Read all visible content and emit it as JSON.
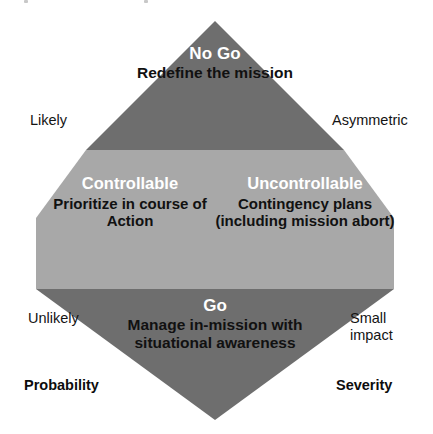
{
  "diagram": {
    "shape": "diamond",
    "colors": {
      "band_dark": "#6e6e6e",
      "band_light": "#a8a8a8",
      "background": "#ffffff",
      "heading_text": "#ffffff",
      "body_text": "#111111",
      "label_text": "#141414"
    },
    "segments": [
      {
        "id": "no-go",
        "position": "top",
        "heading": "No Go",
        "body": "Redefine\nthe mission",
        "fill": "#6e6e6e"
      },
      {
        "id": "controllable",
        "position": "middle-left",
        "heading": "Controllable",
        "body": "Prioritize in\ncourse of\nAction",
        "fill": "#a8a8a8"
      },
      {
        "id": "uncontrollable",
        "position": "middle-right",
        "heading": "Uncontrollable",
        "body": "Contingency\nplans (including\nmission abort)",
        "fill": "#a8a8a8"
      },
      {
        "id": "go",
        "position": "bottom",
        "heading": "Go",
        "body": "Manage in-mission\nwith situational\nawareness",
        "fill": "#6e6e6e"
      }
    ]
  },
  "axes": {
    "left": {
      "title": "Probability",
      "high_label": "Likely",
      "low_label": "Unlikely"
    },
    "right": {
      "title": "Severity",
      "high_label": "Asymmetric",
      "low_label": "Small\nimpact"
    }
  }
}
